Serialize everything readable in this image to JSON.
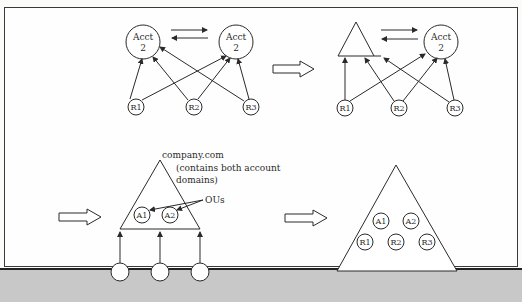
{
  "diagram": {
    "stage1": {
      "accounts": [
        {
          "line1": "Acct",
          "line2": "2"
        },
        {
          "line1": "Acct",
          "line2": "2"
        }
      ],
      "resources": [
        "R1",
        "R2",
        "R3"
      ]
    },
    "stage2": {
      "account": {
        "line1": "Acct",
        "line2": "2"
      },
      "resources": [
        "R1",
        "R2",
        "R3"
      ]
    },
    "stage3": {
      "domain_label": "company.com",
      "domain_note_line1": "(contains both account",
      "domain_note_line2": "domains)",
      "ou_label": "OUs",
      "ous": [
        "A1",
        "A2"
      ]
    },
    "stage4": {
      "ous": [
        "A1",
        "A2"
      ],
      "resources": [
        "R1",
        "R2",
        "R3"
      ]
    }
  }
}
